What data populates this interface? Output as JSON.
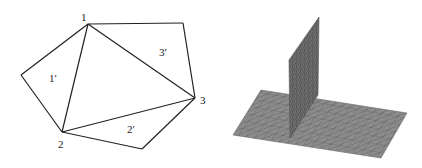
{
  "left_diagram": {
    "description": "Triangulated patch: central triangle 1-2-3 with neighboring triangles 1', 2', 3'",
    "vertices": [
      {
        "id": "1",
        "label": "1",
        "x": 88,
        "y": 24,
        "label_x": 81,
        "label_y": 21
      },
      {
        "id": "2",
        "label": "2",
        "x": 62,
        "y": 132,
        "label_x": 58,
        "label_y": 148
      },
      {
        "id": "3",
        "label": "3",
        "x": 195,
        "y": 98,
        "label_x": 200,
        "label_y": 104
      }
    ],
    "outer_vertices": [
      {
        "id": "A",
        "x": 183,
        "y": 23
      },
      {
        "id": "B",
        "x": 21,
        "y": 75
      },
      {
        "id": "C",
        "x": 142,
        "y": 149
      }
    ],
    "triangle_labels": [
      {
        "label": "1′",
        "x": 49,
        "y": 82
      },
      {
        "label": "2′",
        "x": 127,
        "y": 133
      },
      {
        "label": "3′",
        "x": 159,
        "y": 56
      }
    ],
    "stroke_color": "#222222"
  },
  "right_diagram": {
    "description": "3D triangulated mesh: flat plane with vertical spike (delta function)",
    "plane": {
      "points": "261,90 407,113 381,158 233,135"
    },
    "spike": {
      "points": "290,138 289,60 319,17 318,95"
    },
    "fill_color": "#8c8c8c",
    "spike_color": "#6a6a6a",
    "mesh_color": "#555555"
  }
}
